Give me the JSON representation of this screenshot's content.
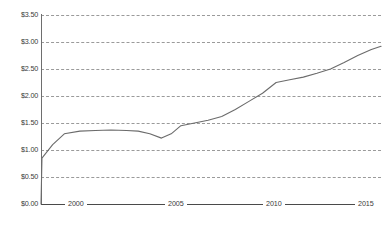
{
  "chart_data": {
    "type": "line",
    "title": "",
    "subtitle": "",
    "xlabel": "",
    "ylabel": "",
    "xlim": [
      1998,
      2015.6
    ],
    "ylim": [
      0.0,
      3.5
    ],
    "grid": true,
    "legend": "none",
    "y_tick_labels": [
      "$3.50",
      "$3.00",
      "$2.50",
      "$2.00",
      "$1.50",
      "$1.00",
      "$0.50",
      "$0.00"
    ],
    "y_tick_values": [
      3.5,
      3.0,
      2.5,
      2.0,
      1.5,
      1.0,
      0.5,
      0.0
    ],
    "x_tick_labels": [
      "2000",
      "2005",
      "2010",
      "2015"
    ],
    "x_tick_values": [
      2000,
      2005,
      2010,
      2015
    ],
    "series": [
      {
        "name": "Price",
        "color": "#6b6b6b",
        "x": [
          1998.0,
          1998.05,
          1998.6,
          1999.2,
          2000.0,
          2000.8,
          2001.6,
          2002.4,
          2003.0,
          2003.6,
          2004.2,
          2004.7,
          2005.2,
          2005.9,
          2006.6,
          2007.3,
          2008.0,
          2008.7,
          2009.4,
          2010.1,
          2010.8,
          2011.5,
          2012.2,
          2012.9,
          2013.6,
          2014.3,
          2015.0,
          2015.5
        ],
        "values": [
          0.0,
          0.85,
          1.1,
          1.3,
          1.35,
          1.36,
          1.37,
          1.36,
          1.35,
          1.3,
          1.22,
          1.3,
          1.45,
          1.5,
          1.55,
          1.62,
          1.75,
          1.9,
          2.05,
          2.25,
          2.3,
          2.35,
          2.42,
          2.5,
          2.62,
          2.75,
          2.86,
          2.92
        ]
      }
    ]
  }
}
